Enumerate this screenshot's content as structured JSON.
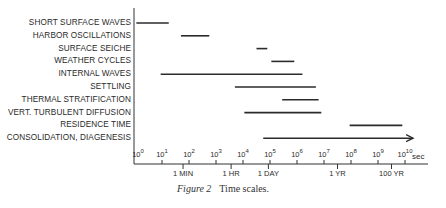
{
  "chart_data": {
    "type": "range-bar",
    "title": "Time scales.",
    "caption_label": "Figure 2",
    "xlabel": "sec",
    "xscale": "log10",
    "xlim_exponent": [
      0,
      10
    ],
    "x_ticks": [
      {
        "exp": 0,
        "label": "10",
        "sup": "0"
      },
      {
        "exp": 1,
        "label": "10",
        "sup": "1"
      },
      {
        "exp": 2,
        "label": "10",
        "sup": "2"
      },
      {
        "exp": 3,
        "label": "10",
        "sup": "3"
      },
      {
        "exp": 4,
        "label": "10",
        "sup": "4"
      },
      {
        "exp": 5,
        "label": "10",
        "sup": "5"
      },
      {
        "exp": 6,
        "label": "10",
        "sup": "6"
      },
      {
        "exp": 7,
        "label": "10",
        "sup": "7"
      },
      {
        "exp": 8,
        "label": "10",
        "sup": "8"
      },
      {
        "exp": 9,
        "label": "10",
        "sup": "9"
      },
      {
        "exp": 10,
        "label": "10",
        "sup": "10"
      }
    ],
    "unit_marks": [
      {
        "label": "1 MIN",
        "exp": 1.78
      },
      {
        "label": "1 HR",
        "exp": 3.56
      },
      {
        "label": "1 DAY",
        "exp": 4.94
      },
      {
        "label": "1 YR",
        "exp": 7.5
      },
      {
        "label": "100 YR",
        "exp": 9.5
      }
    ],
    "categories": [
      "SHORT SURFACE WAVES",
      "HARBOR OSCILLATIONS",
      "SURFACE SEICHE",
      "WEATHER CYCLES",
      "INTERNAL WAVES",
      "SETTLING",
      "THERMAL STRATIFICATION",
      "VERT. TURBULENT DIFFUSION",
      "RESIDENCE TIME",
      "CONSOLIDATION, DIAGENESIS"
    ],
    "ranges_exp": [
      [
        0.05,
        1.25
      ],
      [
        1.7,
        2.75
      ],
      [
        4.5,
        4.9
      ],
      [
        5.05,
        5.9
      ],
      [
        0.95,
        6.2
      ],
      [
        3.7,
        6.7
      ],
      [
        5.45,
        6.8
      ],
      [
        4.05,
        6.9
      ],
      [
        7.95,
        9.9
      ],
      [
        4.75,
        10.3
      ]
    ],
    "arrow": [
      false,
      false,
      false,
      false,
      false,
      false,
      false,
      false,
      false,
      true
    ],
    "grid": false,
    "legend": "none"
  },
  "layout": {
    "axis_x0": 135,
    "px_per_decade": 27,
    "axis_y": 164,
    "row_y0": 23,
    "row_dy": 12.8
  }
}
